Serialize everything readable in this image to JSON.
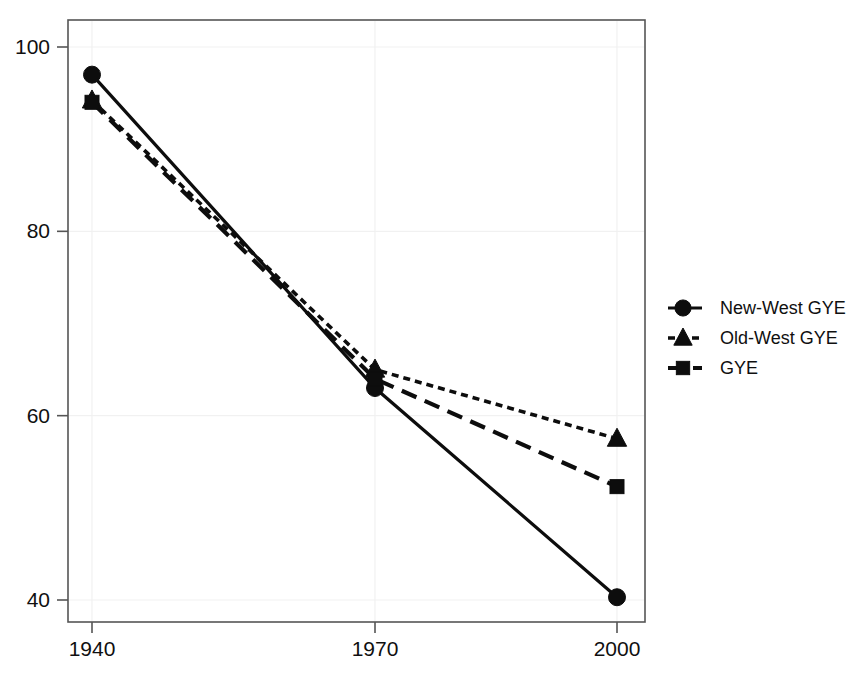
{
  "chart_data": {
    "type": "line",
    "title": "",
    "subtitle": "",
    "xlabel": "",
    "ylabel": "",
    "x": [
      1940,
      1970,
      2000
    ],
    "xtick_labels": [
      "1940",
      "1970",
      "2000"
    ],
    "ytick_labels": [
      "100",
      "80",
      "60",
      "40"
    ],
    "yticks": [
      100,
      80,
      60,
      40
    ],
    "xlim": [
      1932,
      2008
    ],
    "ylim": [
      37,
      103
    ],
    "grid": true,
    "grid_axis": "y",
    "legend_position": "right",
    "series": [
      {
        "name": "New-West GYE",
        "marker": "circle",
        "linestyle": "solid",
        "color": "#0d0d0d",
        "values": [
          97.0,
          63.0,
          40.3
        ]
      },
      {
        "name": "Old-West GYE",
        "marker": "triangle",
        "linestyle": "dotted",
        "color": "#0d0d0d",
        "values": [
          94.2,
          65.0,
          57.5
        ]
      },
      {
        "name": "GYE",
        "marker": "square",
        "linestyle": "dashed",
        "color": "#0d0d0d",
        "values": [
          94.0,
          64.0,
          52.3
        ]
      }
    ]
  },
  "legend": {
    "entries": [
      {
        "label": "New-West GYE",
        "marker": "circle-marker-icon",
        "linestyle": "solid"
      },
      {
        "label": "Old-West GYE",
        "marker": "triangle-marker-icon",
        "linestyle": "dotted"
      },
      {
        "label": "GYE",
        "marker": "square-marker-icon",
        "linestyle": "dashed"
      }
    ]
  },
  "colors": {
    "ink": "#0d0d0d",
    "frame": "#555555",
    "grid": "#f1f1f1",
    "background": "#ffffff"
  }
}
